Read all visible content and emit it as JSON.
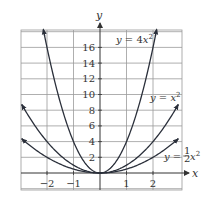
{
  "chart_data": {
    "type": "line",
    "title": "",
    "xlabel": "x",
    "ylabel": "y",
    "xlim": [
      -3,
      3
    ],
    "ylim": [
      -2,
      18
    ],
    "grid": true,
    "x_ticks": [
      -2,
      -1,
      1,
      2
    ],
    "y_ticks": [
      2,
      4,
      6,
      8,
      10,
      12,
      14,
      16
    ],
    "series": [
      {
        "name": "y = 4x^2",
        "label_main": "y = 4x",
        "label_sup": "2",
        "coef": 4,
        "x": [
          -2.15,
          -2,
          -1.5,
          -1,
          -0.5,
          0,
          0.5,
          1,
          1.5,
          2,
          2.15
        ],
        "values": [
          18.5,
          16,
          9,
          4,
          1,
          0,
          1,
          4,
          9,
          16,
          18.5
        ]
      },
      {
        "name": "y = x^2",
        "label_main": "y = x",
        "label_sup": "2",
        "coef": 1,
        "x": [
          -3,
          -2,
          -1,
          0,
          1,
          2,
          3
        ],
        "values": [
          9,
          4,
          1,
          0,
          1,
          4,
          9
        ]
      },
      {
        "name": "y = (1/2)x^2",
        "label_main": "y = ",
        "label_frac_num": "1",
        "label_frac_den": "2",
        "label_var": "x",
        "label_sup": "2",
        "coef": 0.5,
        "x": [
          -3,
          -2,
          -1,
          0,
          1,
          2,
          3
        ],
        "values": [
          4.5,
          2,
          0.5,
          0,
          0.5,
          2,
          4.5
        ]
      }
    ]
  },
  "labels": {
    "x_axis": "x",
    "y_axis": "y",
    "x_ticks": [
      "−2",
      "−1",
      "1",
      "2"
    ],
    "y_ticks": [
      "2",
      "4",
      "6",
      "8",
      "10",
      "12",
      "14",
      "16"
    ]
  }
}
